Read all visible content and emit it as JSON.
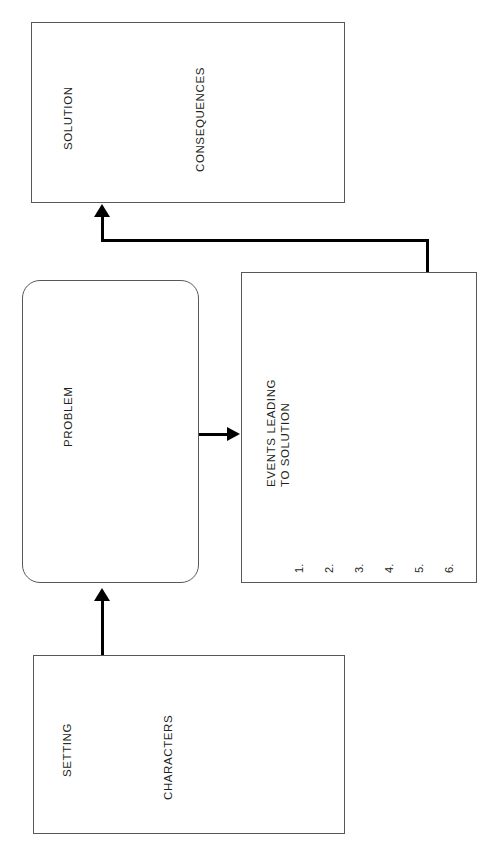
{
  "diagram": {
    "orientation": "landscape-rotated",
    "stroke_color": "#58585a",
    "arrow_color": "#000000",
    "text_color": "#231f20",
    "background_color": "#ffffff"
  },
  "boxes": {
    "solution": {
      "name": "solution-box",
      "shape": "rectangle",
      "labels": {
        "primary": "SOLUTION",
        "secondary": "CONSEQUENCES"
      }
    },
    "problem": {
      "name": "problem-box",
      "shape": "rounded-rectangle",
      "labels": {
        "primary": "PROBLEM"
      }
    },
    "events": {
      "name": "events-box",
      "shape": "rectangle",
      "labels": {
        "line1": "EVENTS LEADING",
        "line2": "TO SOLUTION"
      },
      "list_items": [
        "1.",
        "2.",
        "3.",
        "4.",
        "5.",
        "6."
      ]
    },
    "setting": {
      "name": "setting-box",
      "shape": "rectangle",
      "labels": {
        "primary": "SETTING",
        "secondary": "CHARACTERS"
      }
    }
  },
  "connectors": [
    {
      "name": "setting-to-problem-arrow",
      "from": "setting",
      "to": "problem",
      "style": "straight"
    },
    {
      "name": "problem-to-events-arrow",
      "from": "problem",
      "to": "events",
      "style": "straight"
    },
    {
      "name": "events-to-solution-arrow",
      "from": "events",
      "to": "solution",
      "style": "elbow"
    }
  ]
}
